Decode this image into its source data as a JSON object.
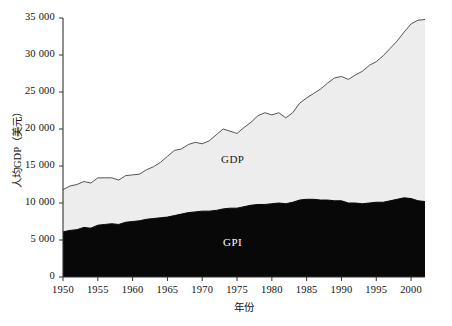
{
  "chart_data": {
    "type": "area",
    "title": "",
    "xlabel": "年份",
    "ylabel": "人均GDP（美元）",
    "xlim": [
      1950,
      2002
    ],
    "ylim": [
      0,
      35000
    ],
    "xticks": [
      1950,
      1955,
      1960,
      1965,
      1970,
      1975,
      1980,
      1985,
      1990,
      1995,
      2000
    ],
    "xtick_labels": [
      "1950",
      "1955",
      "1960",
      "1965",
      "1970",
      "1975",
      "1980",
      "1985",
      "1990",
      "1995",
      "2000"
    ],
    "yticks": [
      0,
      5000,
      10000,
      15000,
      20000,
      25000,
      30000,
      35000
    ],
    "ytick_labels": [
      "0",
      "5 000",
      "10 000",
      "15 000",
      "20 000",
      "25 000",
      "30 000",
      "35 000"
    ],
    "grid": false,
    "legend_position": "inline-annotation",
    "stacked": false,
    "annotations": [
      {
        "text": "GDP",
        "x": 1975,
        "y": 15800
      },
      {
        "text": "GPI",
        "x": 1975,
        "y": 4600
      }
    ],
    "colors": {
      "gdp_fill": "#ededed",
      "gdp_line": "#555555",
      "gpi_fill": "#080808",
      "gpi_line": "#080808",
      "axis": "#333333",
      "background": "#ffffff"
    },
    "x": [
      1950,
      1951,
      1952,
      1953,
      1954,
      1955,
      1956,
      1957,
      1958,
      1959,
      1960,
      1961,
      1962,
      1963,
      1964,
      1965,
      1966,
      1967,
      1968,
      1969,
      1970,
      1971,
      1972,
      1973,
      1974,
      1975,
      1976,
      1977,
      1978,
      1979,
      1980,
      1981,
      1982,
      1983,
      1984,
      1985,
      1986,
      1987,
      1988,
      1989,
      1990,
      1991,
      1992,
      1993,
      1994,
      1995,
      1996,
      1997,
      1998,
      1999,
      2000,
      2001,
      2002
    ],
    "series": [
      {
        "name": "GDP",
        "values": [
          11800,
          12300,
          12500,
          12900,
          12700,
          13400,
          13400,
          13400,
          13100,
          13700,
          13800,
          13900,
          14500,
          14900,
          15500,
          16300,
          17100,
          17300,
          17900,
          18200,
          18000,
          18400,
          19200,
          20000,
          19700,
          19400,
          20200,
          20900,
          21800,
          22200,
          21900,
          22200,
          21500,
          22200,
          23500,
          24200,
          24800,
          25400,
          26200,
          26900,
          27100,
          26700,
          27300,
          27800,
          28600,
          29100,
          29900,
          30900,
          31900,
          33100,
          34200,
          34700,
          34800
        ]
      },
      {
        "name": "GPI",
        "values": [
          6100,
          6300,
          6400,
          6700,
          6600,
          7000,
          7100,
          7200,
          7100,
          7400,
          7500,
          7600,
          7800,
          7900,
          8000,
          8100,
          8300,
          8500,
          8700,
          8800,
          8900,
          8900,
          9000,
          9200,
          9300,
          9300,
          9500,
          9700,
          9800,
          9800,
          9900,
          10000,
          9900,
          10100,
          10400,
          10500,
          10500,
          10400,
          10400,
          10300,
          10300,
          10000,
          10000,
          9900,
          10000,
          10100,
          10100,
          10300,
          10500,
          10700,
          10600,
          10300,
          10200
        ]
      }
    ]
  }
}
